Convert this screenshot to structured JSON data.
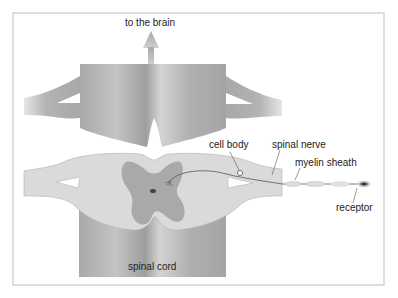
{
  "diagram": {
    "labels": {
      "brain": "to the brain",
      "cell_body": "cell body",
      "spinal_nerve": "spinal nerve",
      "myelin_sheath": "myelin sheath",
      "receptor": "receptor",
      "spinal_cord": "spinal cord"
    },
    "colors": {
      "frame": "#bdbdbd",
      "white_matter": "#d9d9d9",
      "grey_matter": "#a8a8a8",
      "cord_dark": "#9a9a9a",
      "cord_light": "#cfcfcf",
      "arrow": "#b5b5b5",
      "line": "#555555"
    }
  }
}
